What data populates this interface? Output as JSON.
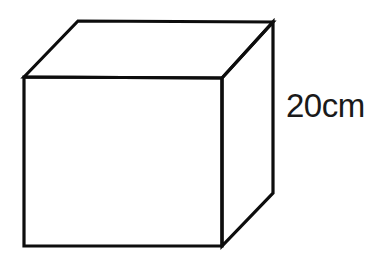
{
  "figure": {
    "kind": "3d-cube-diagram",
    "background_color": "#ffffff",
    "stroke_color": "#0d0d0d",
    "fill_color": "#ffffff",
    "stroke_width": 3.2
  },
  "labels": {
    "height": "20cm"
  },
  "geometry": {
    "front_face_points": "24,77 222,78 222,246 24,246",
    "top_face_points": "24,77 78,21 273,22 222,78",
    "right_face_points": "222,78 273,22 273,193 222,246",
    "front_face_path": "M24,77 L222,78 L222,246 L24,246 Z",
    "top_face_path": "M24,77 L78,21 L273,22 L222,78 Z",
    "right_face_path": "M222,78 L273,22 L273,193 L222,246 Z"
  }
}
